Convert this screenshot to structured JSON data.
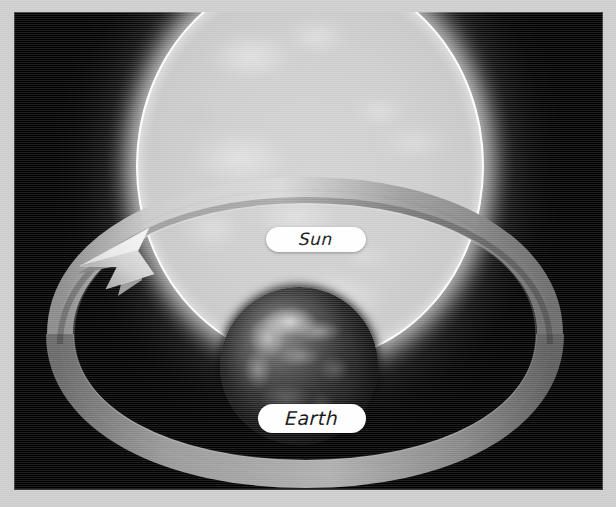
{
  "diagram": {
    "background_color": "#000000",
    "frame_color": "#cdcdcd",
    "labels": [
      {
        "id": "sun",
        "text": "Sun",
        "pill_color": "#ffffff",
        "text_color": "#111111"
      },
      {
        "id": "earth",
        "text": "Earth",
        "pill_color": "#ffffff",
        "text_color": "#111111"
      }
    ],
    "bodies": [
      {
        "id": "sun-body",
        "name": "Sun",
        "shape": "sphere",
        "color": "#cdcdcd"
      },
      {
        "id": "earth-body",
        "name": "Earth",
        "shape": "sphere",
        "color": "#1a1a1a"
      }
    ],
    "orbit": {
      "name": "Earth orbital path",
      "color": "#a8a8a8",
      "direction": "counter-clockwise",
      "arrow_position": "upper-left"
    }
  }
}
